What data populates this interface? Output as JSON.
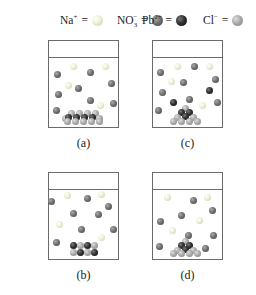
{
  "legend": [
    {
      "symbol_main": "Na",
      "sup": "+",
      "sub": "",
      "equals": "=",
      "icon": "na-ion-ball",
      "color": "#e6e6c8"
    },
    {
      "symbol_main": "NO",
      "sup": "−",
      "sub": "3",
      "equals": "=",
      "icon": "nitrate-ion-ball",
      "color": "#6e6e6e"
    },
    {
      "symbol_main": "Pb",
      "sup": "2+",
      "sub": "",
      "equals": "=",
      "icon": "lead-ion-ball",
      "color": "#2f2f2f"
    },
    {
      "symbol_main": "Cl",
      "sup": "−",
      "sub": "",
      "equals": "=",
      "icon": "chloride-ion-ball",
      "color": "#a8a8a8"
    }
  ],
  "colors": {
    "na": "#e8e8cc",
    "no3": "#6c6c6c",
    "pb": "#2c2c2c",
    "cl": "#a6a6a6",
    "beaker_border": "#6a6a6a"
  },
  "beakers": [
    {
      "id": "a",
      "label": "(a)",
      "x": 48,
      "y": 40,
      "label_y": 136,
      "dissolved": [
        {
          "t": "na",
          "x": 24,
          "y": 25
        },
        {
          "t": "no3",
          "x": 41,
          "y": 31
        },
        {
          "t": "na",
          "x": 56,
          "y": 25
        },
        {
          "t": "no3",
          "x": 8,
          "y": 33
        },
        {
          "t": "na",
          "x": 19,
          "y": 44
        },
        {
          "t": "no3",
          "x": 29,
          "y": 47
        },
        {
          "t": "no3",
          "x": 62,
          "y": 42
        },
        {
          "t": "no3",
          "x": 9,
          "y": 53
        },
        {
          "t": "no3",
          "x": 41,
          "y": 59
        },
        {
          "t": "na",
          "x": 51,
          "y": 64
        },
        {
          "t": "no3",
          "x": 64,
          "y": 62
        },
        {
          "t": "no3",
          "x": 7,
          "y": 69
        }
      ],
      "precipitate": [
        {
          "t": "cl",
          "x": 22,
          "y": 72
        },
        {
          "t": "cl",
          "x": 30,
          "y": 72
        },
        {
          "t": "cl",
          "x": 38,
          "y": 72
        },
        {
          "t": "cl",
          "x": 46,
          "y": 72
        },
        {
          "t": "cl",
          "x": 16,
          "y": 77
        },
        {
          "t": "pb",
          "x": 19,
          "y": 76
        },
        {
          "t": "pb",
          "x": 27,
          "y": 76
        },
        {
          "t": "pb",
          "x": 35,
          "y": 76
        },
        {
          "t": "pb",
          "x": 43,
          "y": 76
        },
        {
          "t": "cl",
          "x": 50,
          "y": 77
        },
        {
          "t": "cl",
          "x": 18,
          "y": 80
        },
        {
          "t": "cl",
          "x": 26,
          "y": 80
        },
        {
          "t": "cl",
          "x": 34,
          "y": 80
        },
        {
          "t": "cl",
          "x": 42,
          "y": 80
        },
        {
          "t": "cl",
          "x": 50,
          "y": 80
        }
      ]
    },
    {
      "id": "c",
      "label": "(c)",
      "x": 152,
      "y": 40,
      "label_y": 136,
      "dissolved": [
        {
          "t": "na",
          "x": 24,
          "y": 25
        },
        {
          "t": "no3",
          "x": 41,
          "y": 25
        },
        {
          "t": "na",
          "x": 56,
          "y": 25
        },
        {
          "t": "no3",
          "x": 7,
          "y": 31
        },
        {
          "t": "na",
          "x": 18,
          "y": 40
        },
        {
          "t": "no3",
          "x": 30,
          "y": 41
        },
        {
          "t": "no3",
          "x": 62,
          "y": 38
        },
        {
          "t": "pb",
          "x": 56,
          "y": 49
        },
        {
          "t": "no3",
          "x": 9,
          "y": 51
        },
        {
          "t": "pb",
          "x": 20,
          "y": 61
        },
        {
          "t": "no3",
          "x": 36,
          "y": 58
        },
        {
          "t": "na",
          "x": 49,
          "y": 64
        },
        {
          "t": "no3",
          "x": 64,
          "y": 61
        },
        {
          "t": "no3",
          "x": 5,
          "y": 69
        }
      ],
      "precipitate": [
        {
          "t": "cl",
          "x": 32,
          "y": 67
        },
        {
          "t": "pb",
          "x": 28,
          "y": 71
        },
        {
          "t": "pb",
          "x": 36,
          "y": 71
        },
        {
          "t": "cl",
          "x": 24,
          "y": 76
        },
        {
          "t": "pb",
          "x": 32,
          "y": 75
        },
        {
          "t": "cl",
          "x": 40,
          "y": 76
        },
        {
          "t": "cl",
          "x": 20,
          "y": 80
        },
        {
          "t": "cl",
          "x": 28,
          "y": 80
        },
        {
          "t": "cl",
          "x": 36,
          "y": 80
        },
        {
          "t": "cl",
          "x": 44,
          "y": 80
        }
      ]
    },
    {
      "id": "b",
      "label": "(b)",
      "x": 48,
      "y": 172,
      "label_y": 268,
      "dissolved": [
        {
          "t": "no3",
          "x": 2,
          "y": 28
        },
        {
          "t": "na",
          "x": 18,
          "y": 22
        },
        {
          "t": "no3",
          "x": 38,
          "y": 25
        },
        {
          "t": "na",
          "x": 52,
          "y": 21
        },
        {
          "t": "no3",
          "x": 59,
          "y": 33
        },
        {
          "t": "no3",
          "x": 24,
          "y": 40
        },
        {
          "t": "no3",
          "x": 49,
          "y": 41
        },
        {
          "t": "na",
          "x": 10,
          "y": 51
        },
        {
          "t": "no3",
          "x": 32,
          "y": 56
        },
        {
          "t": "no3",
          "x": 64,
          "y": 56
        },
        {
          "t": "na",
          "x": 52,
          "y": 64
        },
        {
          "t": "no3",
          "x": 7,
          "y": 69
        }
      ],
      "precipitate": [
        {
          "t": "pb",
          "x": 24,
          "y": 72
        },
        {
          "t": "cl",
          "x": 31,
          "y": 72
        },
        {
          "t": "pb",
          "x": 38,
          "y": 72
        },
        {
          "t": "cl",
          "x": 45,
          "y": 72
        },
        {
          "t": "cl",
          "x": 24,
          "y": 79
        },
        {
          "t": "pb",
          "x": 31,
          "y": 79
        },
        {
          "t": "cl",
          "x": 38,
          "y": 79
        },
        {
          "t": "pb",
          "x": 45,
          "y": 79
        }
      ]
    },
    {
      "id": "d",
      "label": "(d)",
      "x": 152,
      "y": 172,
      "label_y": 268,
      "dissolved": [
        {
          "t": "na",
          "x": 14,
          "y": 24
        },
        {
          "t": "no3",
          "x": 40,
          "y": 27
        },
        {
          "t": "na",
          "x": 54,
          "y": 24
        },
        {
          "t": "no3",
          "x": 59,
          "y": 37
        },
        {
          "t": "no3",
          "x": 28,
          "y": 42
        },
        {
          "t": "na",
          "x": 46,
          "y": 47
        },
        {
          "t": "no3",
          "x": 7,
          "y": 48
        },
        {
          "t": "na",
          "x": 19,
          "y": 57
        },
        {
          "t": "no3",
          "x": 35,
          "y": 62
        },
        {
          "t": "no3",
          "x": 60,
          "y": 62
        },
        {
          "t": "no3",
          "x": 6,
          "y": 73
        },
        {
          "t": "no3",
          "x": 52,
          "y": 75
        }
      ],
      "precipitate": [
        {
          "t": "cl",
          "x": 32,
          "y": 68
        },
        {
          "t": "pb",
          "x": 28,
          "y": 72
        },
        {
          "t": "pb",
          "x": 36,
          "y": 72
        },
        {
          "t": "cl",
          "x": 24,
          "y": 77
        },
        {
          "t": "pb",
          "x": 32,
          "y": 76
        },
        {
          "t": "cl",
          "x": 40,
          "y": 77
        },
        {
          "t": "cl",
          "x": 20,
          "y": 80
        },
        {
          "t": "cl",
          "x": 28,
          "y": 80
        },
        {
          "t": "cl",
          "x": 36,
          "y": 80
        },
        {
          "t": "cl",
          "x": 44,
          "y": 80
        }
      ]
    }
  ]
}
